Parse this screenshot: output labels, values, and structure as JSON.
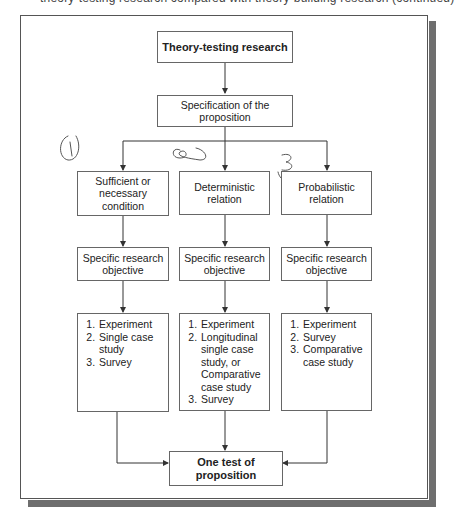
{
  "page": {
    "cut_off_caption": "theory-testing research compared with theory-building research (continued)"
  },
  "diagram": {
    "title_box": "Theory-testing research",
    "specification_box": "Specification of the proposition",
    "branches": [
      {
        "condition": "Sufficient or necessary condition",
        "objective": "Specific research objective",
        "methods": [
          "Experiment",
          "Single case study",
          "Survey"
        ],
        "annotation": "1"
      },
      {
        "condition": "Deterministic relation",
        "objective": "Specific research objective",
        "methods": [
          "Experiment",
          "Longitudinal single case study, or Comparative case study",
          "Survey"
        ],
        "annotation": "2"
      },
      {
        "condition": "Probabilistic relation",
        "objective": "Specific research objective",
        "methods": [
          "Experiment",
          "Survey",
          "Comparative case study"
        ],
        "annotation": "3"
      }
    ],
    "result_box": "One test of proposition"
  },
  "colors": {
    "line": "#333333",
    "box_border": "#666666",
    "shadow": "#6e6e6e",
    "annotation": "#555555"
  }
}
